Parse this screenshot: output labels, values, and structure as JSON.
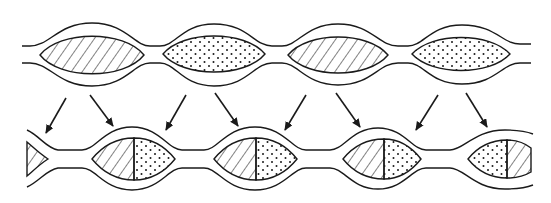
{
  "figure": {
    "stroke_color": "#1a1a1a",
    "background": "#ffffff",
    "top_row": {
      "label": "original chain",
      "pods": [
        {
          "cx": 92,
          "fill": "hatch"
        },
        {
          "cx": 214,
          "fill": "dots"
        },
        {
          "cx": 338,
          "fill": "hatch"
        },
        {
          "cx": 462,
          "fill": "dots"
        }
      ]
    },
    "bottom_row": {
      "label": "reformed chain",
      "pods": [
        {
          "cx": 132,
          "left": "hatch",
          "right": "dots"
        },
        {
          "cx": 255,
          "left": "hatch",
          "right": "dots"
        },
        {
          "cx": 378,
          "left": "hatch",
          "right": "dots"
        },
        {
          "cx": 505,
          "left": "dots",
          "right": "hatch"
        }
      ]
    },
    "arrows": [
      {
        "x1": 66,
        "y1": 98,
        "x2": 46,
        "y2": 133
      },
      {
        "x1": 90,
        "y1": 95,
        "x2": 113,
        "y2": 126
      },
      {
        "x1": 186,
        "y1": 95,
        "x2": 166,
        "y2": 130
      },
      {
        "x1": 215,
        "y1": 93,
        "x2": 238,
        "y2": 126
      },
      {
        "x1": 306,
        "y1": 95,
        "x2": 285,
        "y2": 130
      },
      {
        "x1": 336,
        "y1": 93,
        "x2": 360,
        "y2": 127
      },
      {
        "x1": 438,
        "y1": 95,
        "x2": 416,
        "y2": 130
      },
      {
        "x1": 466,
        "y1": 93,
        "x2": 487,
        "y2": 127
      }
    ]
  }
}
